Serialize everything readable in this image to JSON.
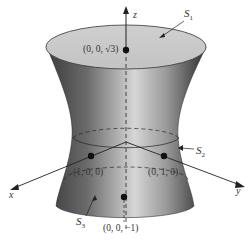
{
  "figure": {
    "type": "hyperboloid of one sheet with caps",
    "axes": {
      "x": "x",
      "y": "y",
      "z": "z"
    },
    "surfaces": {
      "s1": "S",
      "s1_sub": "1",
      "s2": "S",
      "s2_sub": "2",
      "s3": "S",
      "s3_sub": "3"
    },
    "points": {
      "top": "(0, 0, √3)",
      "x_point": "(1, 0, 0)",
      "y_point": "(0, 1, 0)",
      "bottom": "(0, 0, −1)"
    },
    "colors": {
      "surface_dark": "#3a3a3a",
      "surface_light": "#d8d8d8",
      "cap": "#c9c9c9",
      "line": "#222222"
    }
  }
}
